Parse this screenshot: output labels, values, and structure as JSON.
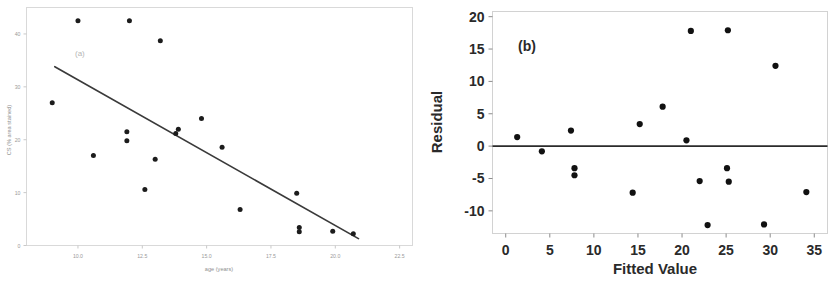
{
  "figure": {
    "width": 837,
    "height": 282,
    "background": "#ffffff"
  },
  "chart_data": [
    {
      "id": "panel-a",
      "type": "scatter",
      "title": "(a)",
      "panel_label": "(a)",
      "xlabel": "age (years)",
      "ylabel": "CS (% area stained)",
      "xlim": [
        8.0,
        23.0
      ],
      "ylim": [
        0,
        45
      ],
      "xticks": [
        10.0,
        12.5,
        15.0,
        17.5,
        20.0,
        22.5
      ],
      "xticklabels": [
        "10.0",
        "12.5",
        "15.0",
        "17.5",
        "20.0",
        "22.5"
      ],
      "yticks": [
        0,
        10,
        20,
        30,
        40
      ],
      "yticklabels": [
        "0",
        "10",
        "20",
        "30",
        "40"
      ],
      "grid": false,
      "legend": "none",
      "x": [
        9.0,
        10.0,
        10.6,
        11.9,
        11.9,
        12.0,
        12.6,
        13.0,
        13.2,
        13.8,
        13.9,
        14.8,
        15.6,
        16.3,
        18.5,
        18.6,
        18.6,
        19.9,
        20.7
      ],
      "y": [
        27.0,
        42.5,
        17.0,
        21.5,
        19.8,
        42.5,
        10.6,
        16.3,
        38.7,
        21.2,
        22.0,
        24.0,
        18.6,
        6.8,
        9.9,
        3.4,
        2.6,
        2.7,
        2.2
      ],
      "fit_line": {
        "type": "linear-regression",
        "x_start": 9.1,
        "y_start": 33.8,
        "x_end": 20.9,
        "y_end": 1.3
      },
      "n_points": 19
    },
    {
      "id": "panel-b",
      "type": "scatter",
      "title": "(b)",
      "panel_label": "(b)",
      "xlabel": "Fitted Value",
      "ylabel": "Residual",
      "xlim": [
        -1.5,
        36.5
      ],
      "ylim": [
        -13.5,
        20.8
      ],
      "xticks": [
        0,
        5,
        10,
        15,
        20,
        25,
        30,
        35
      ],
      "xticklabels": [
        "0",
        "5",
        "10",
        "15",
        "20",
        "25",
        "30",
        "35"
      ],
      "yticks": [
        -10,
        -5,
        0,
        5,
        10,
        15,
        20
      ],
      "yticklabels": [
        "-10",
        "-5",
        "0",
        "5",
        "10",
        "15",
        "20"
      ],
      "grid": false,
      "legend": "none",
      "reference_line": {
        "type": "horizontal",
        "y": 0
      },
      "x": [
        1.3,
        4.1,
        7.4,
        7.8,
        7.8,
        14.4,
        15.2,
        17.8,
        20.5,
        21.0,
        22.0,
        22.9,
        25.1,
        25.2,
        25.3,
        29.3,
        30.6,
        34.1
      ],
      "y": [
        1.4,
        -0.8,
        2.4,
        -3.4,
        -4.5,
        -7.2,
        3.4,
        6.1,
        0.9,
        17.8,
        -5.4,
        -12.2,
        -3.4,
        17.9,
        -5.5,
        -12.1,
        12.4,
        -7.1
      ],
      "n_points": 18
    }
  ]
}
